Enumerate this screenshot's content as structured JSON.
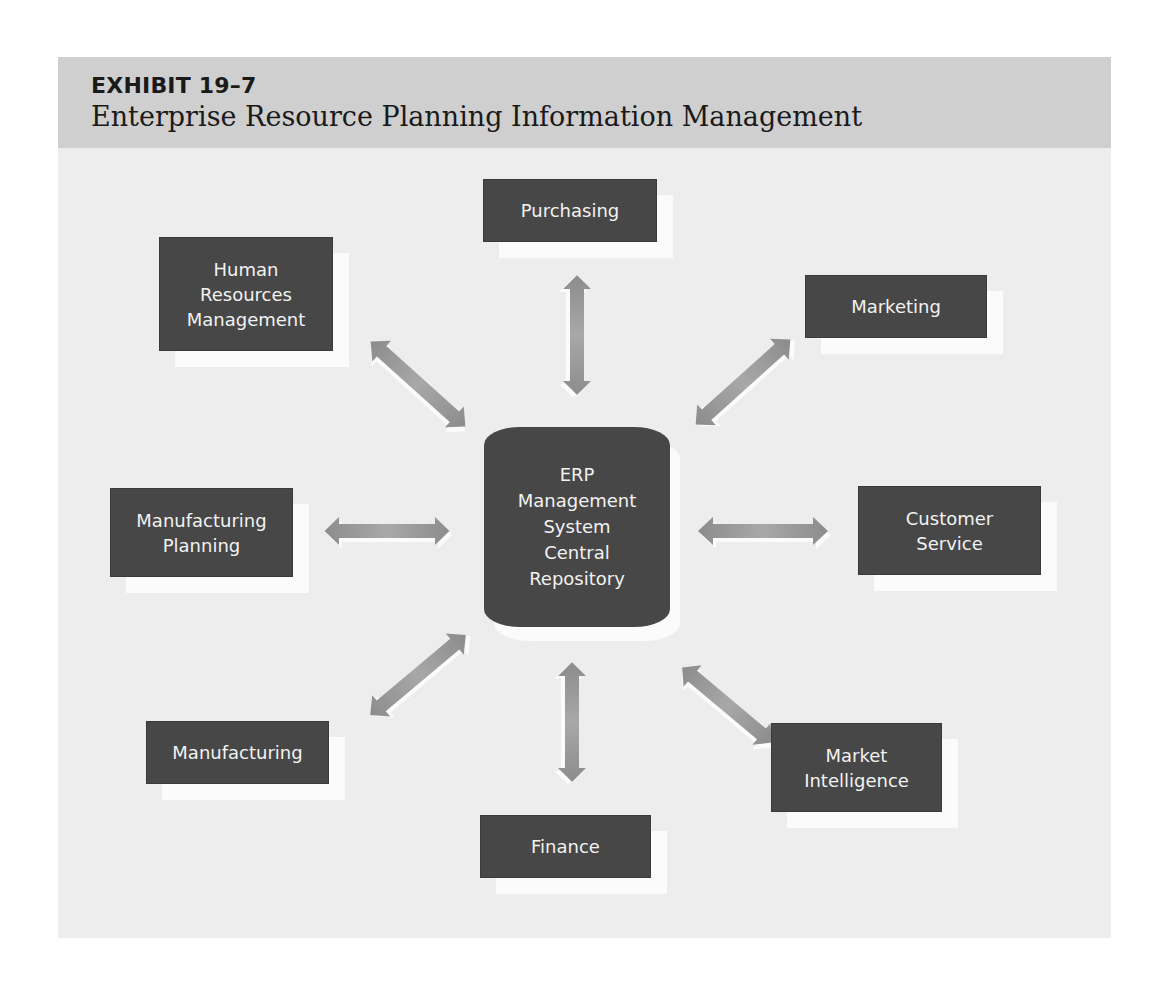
{
  "header": {
    "exhibit_label": "EXHIBIT 19–7",
    "title": "Enterprise Resource Planning Information Management"
  },
  "center": {
    "label": "ERP\nManagement\nSystem\nCentral\nRepository",
    "shape": "cylinder"
  },
  "nodes": [
    {
      "id": "purchasing",
      "label": "Purchasing"
    },
    {
      "id": "marketing",
      "label": "Marketing"
    },
    {
      "id": "customer-service",
      "label": "Customer\nService"
    },
    {
      "id": "market-intelligence",
      "label": "Market\nIntelligence"
    },
    {
      "id": "finance",
      "label": "Finance"
    },
    {
      "id": "manufacturing",
      "label": "Manufacturing"
    },
    {
      "id": "manufacturing-planning",
      "label": "Manufacturing\nPlanning"
    },
    {
      "id": "human-resources-management",
      "label": "Human\nResources\nManagement"
    }
  ],
  "connections": [
    {
      "from": "center",
      "to": "purchasing",
      "type": "bidirectional"
    },
    {
      "from": "center",
      "to": "marketing",
      "type": "bidirectional"
    },
    {
      "from": "center",
      "to": "customer-service",
      "type": "bidirectional"
    },
    {
      "from": "center",
      "to": "market-intelligence",
      "type": "bidirectional"
    },
    {
      "from": "center",
      "to": "finance",
      "type": "bidirectional"
    },
    {
      "from": "center",
      "to": "manufacturing",
      "type": "bidirectional"
    },
    {
      "from": "center",
      "to": "manufacturing-planning",
      "type": "bidirectional"
    },
    {
      "from": "center",
      "to": "human-resources-management",
      "type": "bidirectional"
    }
  ],
  "colors": {
    "panel_bg": "#ededed",
    "header_bg": "#cfcfcf",
    "box_fill": "#474747",
    "box_text": "#f2f2f2",
    "arrow_fill": "#9a9a9a",
    "shadow": "#fbfbfb"
  }
}
